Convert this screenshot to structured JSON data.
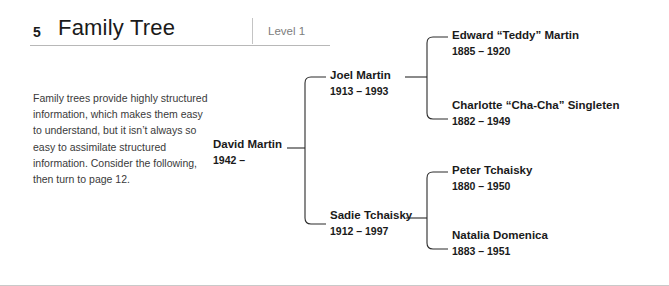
{
  "header": {
    "chapter_number": "5",
    "title": "Family Tree",
    "level": "Level 1"
  },
  "intro": {
    "text": "Family trees provide highly structured information, which makes them easy to understand, but it isn’t always so easy to assimilate structured information. Consider the following, then turn to page 12."
  },
  "tree": {
    "root": {
      "name": "David Martin",
      "dates": "1942 –"
    },
    "generation2": [
      {
        "name": "Joel Martin",
        "dates": "1913 – 1993"
      },
      {
        "name": "Sadie Tchaisky",
        "dates": "1912 – 1997"
      }
    ],
    "generation3": [
      {
        "name": "Edward “Teddy” Martin",
        "dates": "1885 – 1920"
      },
      {
        "name": "Charlotte “Cha-Cha” Singleten",
        "dates": "1882 – 1949"
      },
      {
        "name": "Peter Tchaisky",
        "dates": "1880 – 1950"
      },
      {
        "name": "Natalia Domenica",
        "dates": "1883 – 1951"
      }
    ]
  },
  "colors": {
    "text": "#1a1a1a",
    "body_text": "#3a3a3a",
    "muted": "#7d7d7d",
    "rule": "#b8b8b8",
    "connector": "#2b2b2b"
  }
}
